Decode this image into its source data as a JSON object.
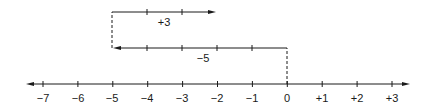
{
  "diagram": {
    "type": "number-line-addition",
    "colors": {
      "ink": "#1a1a1a",
      "background": "#ffffff"
    },
    "axis": {
      "min": -7,
      "max": 3,
      "tick_labels": [
        "−7",
        "−6",
        "−5",
        "−4",
        "−3",
        "−2",
        "−1",
        "0",
        "+1",
        "+2",
        "+3"
      ],
      "arrows": "both"
    },
    "moves": [
      {
        "label": "−5",
        "from": 0,
        "to": -5,
        "direction": "left"
      },
      {
        "label": "+3",
        "from": -5,
        "to": -2,
        "direction": "right"
      }
    ],
    "connectors": [
      {
        "at": 0,
        "style": "dashed"
      },
      {
        "at": -5,
        "style": "dashed"
      }
    ]
  }
}
